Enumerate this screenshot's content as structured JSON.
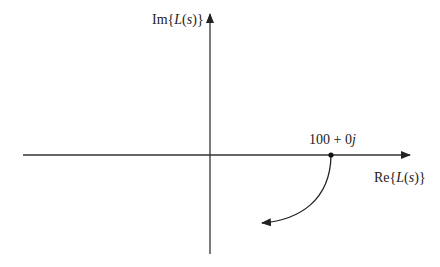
{
  "diagram": {
    "type": "nyquist-plot-sketch",
    "axes": {
      "imaginary_label": {
        "prefix": "Im{",
        "var": "L",
        "paren_open": "(",
        "arg": "s",
        "paren_close": ")",
        "suffix": "}"
      },
      "real_label": {
        "prefix": "Re{",
        "var": "L",
        "paren_open": "(",
        "arg": "s",
        "paren_close": ")",
        "suffix": "}"
      }
    },
    "point": {
      "label_num": "100 + 0",
      "label_j": "j"
    },
    "curve": "clockwise arc from 100+0j downward into lower half-plane, arrow pointing left"
  }
}
